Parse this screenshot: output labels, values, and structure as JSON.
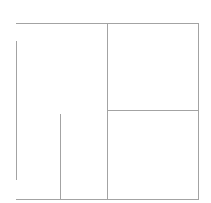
{
  "diagram": {
    "type": "panel-layout-wireframe",
    "stroke_color": "#a3a3a3",
    "background_color": "#ffffff",
    "lines": [
      {
        "id": "top-border",
        "orientation": "horizontal",
        "x1": 16,
        "x2": 198,
        "y": 23
      },
      {
        "id": "bottom-border",
        "orientation": "horizontal",
        "x1": 16,
        "x2": 198,
        "y": 199
      },
      {
        "id": "right-border",
        "orientation": "vertical",
        "x": 198,
        "y1": 23,
        "y2": 199
      },
      {
        "id": "center-divider",
        "orientation": "vertical",
        "x": 107,
        "y1": 23,
        "y2": 199
      },
      {
        "id": "right-panel-divider",
        "orientation": "horizontal",
        "x1": 107,
        "x2": 198,
        "y": 110
      },
      {
        "id": "left-vertical-long",
        "orientation": "vertical",
        "x": 16,
        "y1": 41,
        "y2": 180
      },
      {
        "id": "left-vertical-short",
        "orientation": "vertical",
        "x": 60,
        "y1": 114,
        "y2": 198
      }
    ],
    "regions": [
      {
        "id": "left-panel",
        "x": 16,
        "y": 23,
        "w": 91,
        "h": 176
      },
      {
        "id": "right-top-panel",
        "x": 107,
        "y": 23,
        "w": 91,
        "h": 87
      },
      {
        "id": "right-bottom-panel",
        "x": 107,
        "y": 110,
        "w": 91,
        "h": 89
      }
    ]
  }
}
